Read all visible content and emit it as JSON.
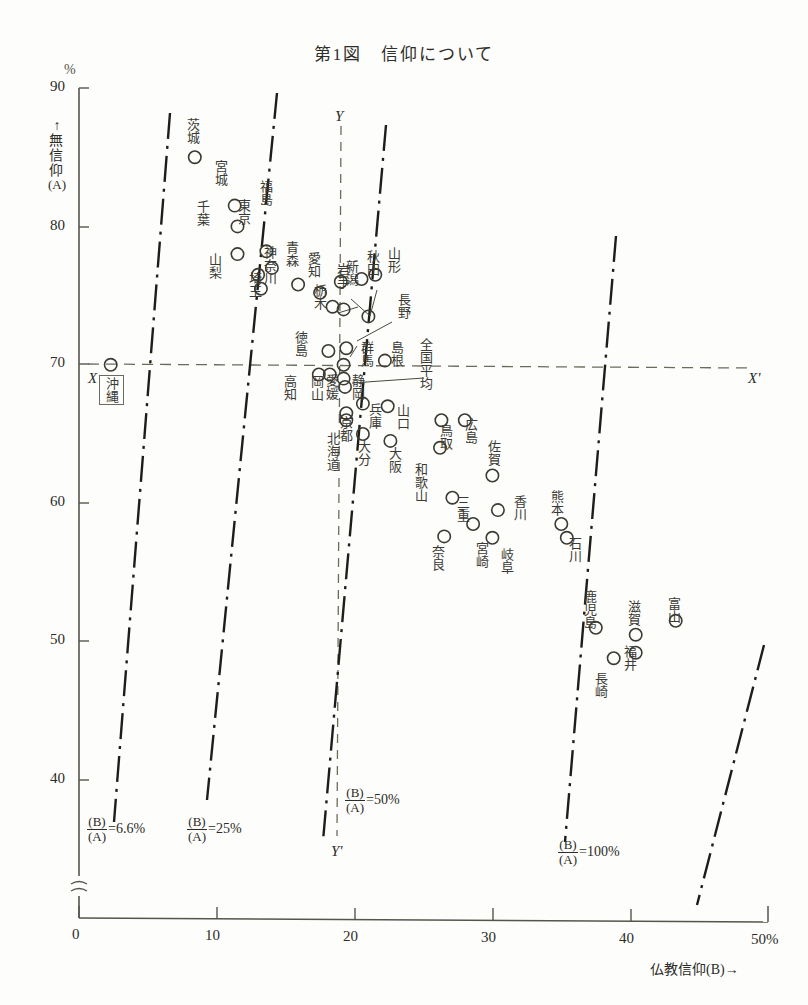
{
  "title": "第1図　信仰について",
  "axes": {
    "y_unit": "%",
    "y_label": "↑無信仰(A)",
    "y_label_arrow": "↑",
    "y_label_text": "無信仰",
    "y_label_paren": "(A)",
    "y_ticks": [
      "90",
      "80",
      "70",
      "60",
      "50",
      "40"
    ],
    "y_zero": "0",
    "x_ticks": [
      "0",
      "10",
      "20",
      "30",
      "40"
    ],
    "x_last_tick": "50%",
    "x_label": "仏教信仰(B)→",
    "break_symbol": "≈"
  },
  "reference_lines": {
    "x_left": "X",
    "x_right": "X'",
    "y_top": "Y",
    "y_bottom": "Y'",
    "horizontal_value": 70,
    "vertical_value": 19.2
  },
  "ratio_lines": [
    {
      "label_num": "(B)",
      "label_den": "(A)",
      "eq": "=6.6%",
      "value": 6.6
    },
    {
      "label_num": "(B)",
      "label_den": "(A)",
      "eq": "=25%",
      "value": 25
    },
    {
      "label_num": "(B)",
      "label_den": "(A)",
      "eq": "=50%",
      "value": 50
    },
    {
      "label_num": "(B)",
      "label_den": "(A)",
      "eq": "=100%",
      "value": 100
    }
  ],
  "okinawa_box_label": "沖縄",
  "chart_data": {
    "type": "scatter",
    "title": "第1図　信仰について",
    "xlabel": "仏教信仰(B)→",
    "ylabel": "↑無信仰(A)",
    "xlim": [
      0,
      50
    ],
    "ylim": [
      38,
      90
    ],
    "grid": false,
    "legend": "none",
    "x_unit": "%",
    "y_unit": "%",
    "annotations": [
      "X–X' : 全国平均 無信仰 70%",
      "Y–Y' : 全国平均 仏教信仰 約19%",
      "(B)/(A)=6.6%",
      "(B)/(A)=25%",
      "(B)/(A)=50%",
      "(B)/(A)=100%"
    ],
    "points": [
      {
        "name": "沖縄",
        "x": 2.3,
        "y": 70.0
      },
      {
        "name": "茨城",
        "x": 8.4,
        "y": 85.0
      },
      {
        "name": "宮城",
        "x": 11.3,
        "y": 81.5
      },
      {
        "name": "東京",
        "x": 11.5,
        "y": 80.0
      },
      {
        "name": "千葉",
        "x": 11.5,
        "y": 78.0
      },
      {
        "name": "福島",
        "x": 13.6,
        "y": 78.2
      },
      {
        "name": "神奈川",
        "x": 14.0,
        "y": 77.0
      },
      {
        "name": "山梨",
        "x": 13.0,
        "y": 76.5
      },
      {
        "name": "埼玉",
        "x": 13.2,
        "y": 75.5
      },
      {
        "name": "青森",
        "x": 15.9,
        "y": 75.8
      },
      {
        "name": "愛知",
        "x": 17.5,
        "y": 75.2
      },
      {
        "name": "栃木",
        "x": 18.4,
        "y": 74.2
      },
      {
        "name": "岩手",
        "x": 19.2,
        "y": 74.0
      },
      {
        "name": "新潟",
        "x": 19.0,
        "y": 76.0
      },
      {
        "name": "秋田",
        "x": 20.5,
        "y": 76.2
      },
      {
        "name": "山形",
        "x": 21.5,
        "y": 76.5
      },
      {
        "name": "長野",
        "x": 21.0,
        "y": 73.5
      },
      {
        "name": "徳島",
        "x": 18.1,
        "y": 71.0
      },
      {
        "name": "群馬",
        "x": 19.4,
        "y": 71.2
      },
      {
        "name": "島根",
        "x": 22.2,
        "y": 70.3
      },
      {
        "name": "全国平均",
        "x": 19.2,
        "y": 70.0
      },
      {
        "name": "高知",
        "x": 17.4,
        "y": 69.3
      },
      {
        "name": "岡山",
        "x": 18.2,
        "y": 69.3
      },
      {
        "name": "愛媛",
        "x": 19.2,
        "y": 69.0
      },
      {
        "name": "静岡",
        "x": 19.3,
        "y": 68.4
      },
      {
        "name": "京都",
        "x": 19.4,
        "y": 66.5
      },
      {
        "name": "北海道",
        "x": 19.4,
        "y": 66.0
      },
      {
        "name": "兵庫",
        "x": 20.6,
        "y": 67.2
      },
      {
        "name": "山口",
        "x": 22.4,
        "y": 67.0
      },
      {
        "name": "大分",
        "x": 20.6,
        "y": 65.0
      },
      {
        "name": "大阪",
        "x": 22.6,
        "y": 64.5
      },
      {
        "name": "鳥取",
        "x": 26.3,
        "y": 66.0
      },
      {
        "name": "広島",
        "x": 28.0,
        "y": 66.0
      },
      {
        "name": "和歌山",
        "x": 26.2,
        "y": 64.0
      },
      {
        "name": "佐賀",
        "x": 30.0,
        "y": 62.0
      },
      {
        "name": "三重",
        "x": 27.1,
        "y": 60.4
      },
      {
        "name": "香川",
        "x": 30.4,
        "y": 59.5
      },
      {
        "name": "熊本",
        "x": 35.0,
        "y": 58.5
      },
      {
        "name": "石川",
        "x": 35.4,
        "y": 57.5
      },
      {
        "name": "奈良",
        "x": 26.5,
        "y": 57.6
      },
      {
        "name": "宮崎",
        "x": 28.6,
        "y": 58.5
      },
      {
        "name": "岐阜",
        "x": 30.0,
        "y": 57.5
      },
      {
        "name": "鹿児島",
        "x": 37.5,
        "y": 51.0
      },
      {
        "name": "滋賀",
        "x": 40.4,
        "y": 50.5
      },
      {
        "name": "福井",
        "x": 40.4,
        "y": 49.2
      },
      {
        "name": "富山",
        "x": 43.3,
        "y": 51.5
      },
      {
        "name": "長崎",
        "x": 38.8,
        "y": 48.8
      }
    ]
  },
  "point_labels": [
    {
      "name": "茨城",
      "lx": 186,
      "ly": 118,
      "mx": 192,
      "my": 158,
      "vertical": true
    },
    {
      "name": "宮城",
      "lx": 214,
      "ly": 160,
      "mx": 221,
      "my": 200,
      "vertical": true
    },
    {
      "name": "千葉",
      "lx": 196,
      "ly": 200,
      "mx": 223,
      "my": 213,
      "vertical": true
    },
    {
      "name": "東京",
      "lx": 237,
      "ly": 199,
      "mx": 228,
      "my": 238,
      "vertical": true
    },
    {
      "name": "福島",
      "lx": 259,
      "ly": 180,
      "mx": 249,
      "my": 214,
      "vertical": true
    },
    {
      "name": "神奈川",
      "lx": 263,
      "ly": 246,
      "mx": 248,
      "my": 262,
      "vertical": true
    },
    {
      "name": "山梨",
      "lx": 208,
      "ly": 253,
      "mx": 238,
      "my": 269,
      "vertical": true
    },
    {
      "name": "埼玉",
      "lx": 248,
      "ly": 272,
      "mx": 239,
      "my": 283,
      "vertical": true
    },
    {
      "name": "青森",
      "lx": 285,
      "ly": 241,
      "mx": 294,
      "my": 282,
      "vertical": true
    },
    {
      "name": "愛知",
      "lx": 307,
      "ly": 252,
      "mx": 315,
      "my": 292,
      "vertical": true
    },
    {
      "name": "栃木",
      "lx": 313,
      "ly": 284,
      "mx": 336,
      "my": 305,
      "vertical": true
    },
    {
      "name": "岩手",
      "lx": 336,
      "ly": 263,
      "mx": 343,
      "my": 310,
      "vertical": true
    },
    {
      "name": "新潟",
      "lx": 345,
      "ly": 260,
      "mx": 362,
      "my": 316,
      "vertical": true
    },
    {
      "name": "秋田",
      "lx": 366,
      "ly": 250,
      "mx": 0,
      "my": 0,
      "vertical": true
    },
    {
      "name": "山形",
      "lx": 387,
      "ly": 247,
      "mx": 0,
      "my": 0,
      "vertical": true
    },
    {
      "name": "長野",
      "lx": 397,
      "ly": 293,
      "mx": 0,
      "my": 0,
      "vertical": true
    },
    {
      "name": "徳島",
      "lx": 294,
      "ly": 331,
      "mx": 0,
      "my": 0,
      "vertical": true
    },
    {
      "name": "群馬",
      "lx": 360,
      "ly": 341,
      "mx": 0,
      "my": 0,
      "vertical": true
    },
    {
      "name": "島根",
      "lx": 390,
      "ly": 341,
      "mx": 0,
      "my": 0,
      "vertical": true
    },
    {
      "name": "全国平均",
      "lx": 419,
      "ly": 338,
      "mx": 0,
      "my": 0,
      "vertical": true
    },
    {
      "name": "高知",
      "lx": 283,
      "ly": 375,
      "mx": 0,
      "my": 0,
      "vertical": true
    },
    {
      "name": "岡山",
      "lx": 310,
      "ly": 375,
      "mx": 0,
      "my": 0,
      "vertical": true
    },
    {
      "name": "愛媛",
      "lx": 325,
      "ly": 374,
      "mx": 0,
      "my": 0,
      "vertical": true
    },
    {
      "name": "静岡",
      "lx": 351,
      "ly": 374,
      "mx": 0,
      "my": 0,
      "vertical": true
    },
    {
      "name": "京都",
      "lx": 339,
      "ly": 416,
      "mx": 0,
      "my": 0,
      "vertical": true
    },
    {
      "name": "北海道",
      "lx": 326,
      "ly": 432,
      "mx": 0,
      "my": 0,
      "vertical": true
    },
    {
      "name": "兵庫",
      "lx": 368,
      "ly": 403,
      "mx": 0,
      "my": 0,
      "vertical": true
    },
    {
      "name": "山口",
      "lx": 396,
      "ly": 404,
      "mx": 0,
      "my": 0,
      "vertical": true
    },
    {
      "name": "大分",
      "lx": 357,
      "ly": 440,
      "mx": 0,
      "my": 0,
      "vertical": true
    },
    {
      "name": "大阪",
      "lx": 388,
      "ly": 447,
      "mx": 0,
      "my": 0,
      "vertical": true
    },
    {
      "name": "鳥取",
      "lx": 439,
      "ly": 424,
      "mx": 0,
      "my": 0,
      "vertical": true
    },
    {
      "name": "広島",
      "lx": 464,
      "ly": 418,
      "mx": 0,
      "my": 0,
      "vertical": true
    },
    {
      "name": "和歌山",
      "lx": 414,
      "ly": 463,
      "mx": 0,
      "my": 0,
      "vertical": true
    },
    {
      "name": "佐賀",
      "lx": 487,
      "ly": 440,
      "mx": 0,
      "my": 0,
      "vertical": true
    },
    {
      "name": "三重",
      "lx": 456,
      "ly": 496,
      "mx": 0,
      "my": 0,
      "vertical": true
    },
    {
      "name": "香川",
      "lx": 513,
      "ly": 495,
      "mx": 0,
      "my": 0,
      "vertical": true
    },
    {
      "name": "熊本",
      "lx": 550,
      "ly": 490,
      "mx": 0,
      "my": 0,
      "vertical": true
    },
    {
      "name": "石川",
      "lx": 568,
      "ly": 537,
      "mx": 0,
      "my": 0,
      "vertical": true
    },
    {
      "name": "奈良",
      "lx": 431,
      "ly": 545,
      "mx": 0,
      "my": 0,
      "vertical": true
    },
    {
      "name": "宮崎",
      "lx": 475,
      "ly": 542,
      "mx": 0,
      "my": 0,
      "vertical": true
    },
    {
      "name": "岐阜",
      "lx": 500,
      "ly": 548,
      "mx": 0,
      "my": 0,
      "vertical": true
    },
    {
      "name": "鹿児島",
      "lx": 583,
      "ly": 590,
      "mx": 0,
      "my": 0,
      "vertical": true
    },
    {
      "name": "滋賀",
      "lx": 627,
      "ly": 600,
      "mx": 0,
      "my": 0,
      "vertical": true
    },
    {
      "name": "福井",
      "lx": 623,
      "ly": 645,
      "mx": 0,
      "my": 0,
      "vertical": true
    },
    {
      "name": "富山",
      "lx": 667,
      "ly": 597,
      "mx": 0,
      "my": 0,
      "vertical": true
    },
    {
      "name": "長崎",
      "lx": 594,
      "ly": 672,
      "mx": 0,
      "my": 0,
      "vertical": true
    }
  ]
}
